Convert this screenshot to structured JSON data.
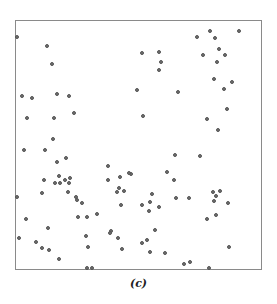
{
  "caption": "(c)",
  "chart_data": {
    "type": "scatter",
    "title": "",
    "caption": "(c)",
    "xlabel": "",
    "ylabel": "",
    "xlim": [
      0,
      1
    ],
    "ylim": [
      0,
      1
    ],
    "grid": false,
    "axes_ticks": false,
    "frame_px": {
      "left": 15,
      "top": 20,
      "right": 262,
      "bottom": 270
    },
    "point_color": "#6f6f6f",
    "points_px": [
      [
        17,
        37
      ],
      [
        47,
        46
      ],
      [
        52,
        64
      ],
      [
        22,
        96
      ],
      [
        32,
        98
      ],
      [
        57,
        94
      ],
      [
        69,
        96
      ],
      [
        27,
        118
      ],
      [
        54,
        118
      ],
      [
        74,
        113
      ],
      [
        53,
        139
      ],
      [
        24,
        150
      ],
      [
        142,
        53
      ],
      [
        159,
        52
      ],
      [
        161,
        62
      ],
      [
        159,
        70
      ],
      [
        178,
        92
      ],
      [
        137,
        90
      ],
      [
        197,
        37
      ],
      [
        210,
        31
      ],
      [
        215,
        38
      ],
      [
        219,
        49
      ],
      [
        203,
        55
      ],
      [
        225,
        55
      ],
      [
        217,
        62
      ],
      [
        239,
        31
      ],
      [
        214,
        79
      ],
      [
        232,
        82
      ],
      [
        224,
        89
      ],
      [
        227,
        109
      ],
      [
        207,
        119
      ],
      [
        143,
        116
      ],
      [
        175,
        155
      ],
      [
        167,
        172
      ],
      [
        142,
        205
      ],
      [
        108,
        166
      ],
      [
        120,
        177
      ],
      [
        131,
        174
      ],
      [
        218,
        130
      ],
      [
        200,
        156
      ],
      [
        17,
        197
      ],
      [
        45,
        150
      ],
      [
        57,
        162
      ],
      [
        66,
        158
      ],
      [
        44,
        180
      ],
      [
        65,
        180
      ],
      [
        70,
        178
      ],
      [
        55,
        183
      ],
      [
        60,
        183
      ],
      [
        59,
        176
      ],
      [
        69,
        183
      ],
      [
        42,
        193
      ],
      [
        26,
        219
      ],
      [
        48,
        228
      ],
      [
        19,
        238
      ],
      [
        36,
        242
      ],
      [
        49,
        250
      ],
      [
        42,
        248
      ],
      [
        59,
        259
      ],
      [
        87,
        268
      ],
      [
        92,
        268
      ],
      [
        77,
        200
      ],
      [
        68,
        192
      ],
      [
        76,
        197
      ],
      [
        82,
        203
      ],
      [
        78,
        217
      ],
      [
        87,
        217
      ],
      [
        97,
        214
      ],
      [
        86,
        236
      ],
      [
        88,
        247
      ],
      [
        108,
        180
      ],
      [
        117,
        192
      ],
      [
        124,
        191
      ],
      [
        121,
        205
      ],
      [
        119,
        188
      ],
      [
        118,
        238
      ],
      [
        111,
        231
      ],
      [
        110,
        233
      ],
      [
        129,
        173
      ],
      [
        150,
        202
      ],
      [
        159,
        207
      ],
      [
        152,
        194
      ],
      [
        155,
        230
      ],
      [
        122,
        249
      ],
      [
        142,
        243
      ],
      [
        147,
        240
      ],
      [
        150,
        252
      ],
      [
        149,
        211
      ],
      [
        165,
        253
      ],
      [
        174,
        180
      ],
      [
        176,
        198
      ],
      [
        189,
        198
      ],
      [
        213,
        192
      ],
      [
        214,
        201
      ],
      [
        216,
        196
      ],
      [
        220,
        191
      ],
      [
        228,
        203
      ],
      [
        207,
        219
      ],
      [
        216,
        215
      ],
      [
        229,
        247
      ],
      [
        190,
        262
      ],
      [
        209,
        268
      ],
      [
        184,
        264
      ]
    ]
  }
}
